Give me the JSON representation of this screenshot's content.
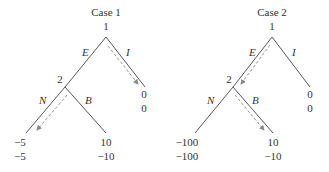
{
  "trees": [
    {
      "title": "Case 1",
      "root_player": "1",
      "second_player": "2",
      "edges": {
        "root_left": "E",
        "root_right": "I",
        "child_left": "N",
        "child_right": "B"
      },
      "payoffs": {
        "I": [
          "0",
          "0"
        ],
        "N": [
          "−5",
          "−5"
        ],
        "B": [
          "10",
          "−10"
        ]
      },
      "equilibrium_path": [
        "I",
        "N"
      ]
    },
    {
      "title": "Case 2",
      "root_player": "1",
      "second_player": "2",
      "edges": {
        "root_left": "E",
        "root_right": "I",
        "child_left": "N",
        "child_right": "B"
      },
      "payoffs": {
        "I": [
          "0",
          "0"
        ],
        "N": [
          "−100",
          "−100"
        ],
        "B": [
          "10",
          "−10"
        ]
      },
      "equilibrium_path": [
        "E",
        "B"
      ]
    }
  ],
  "colors": {
    "edge": "#444444",
    "arrow": "#888888",
    "text": "#333333"
  }
}
